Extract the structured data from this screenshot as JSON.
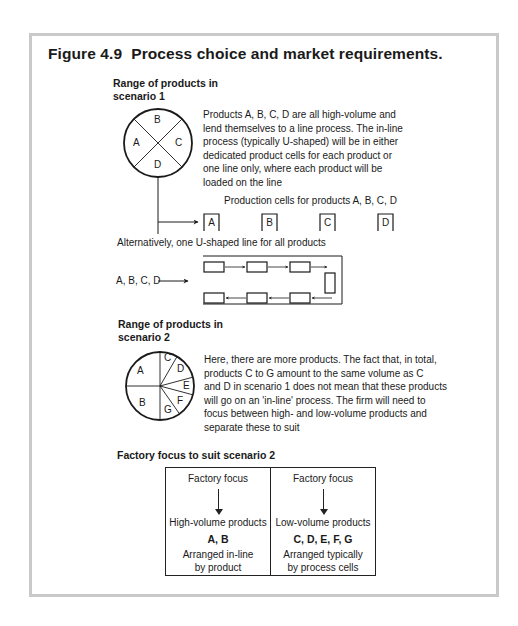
{
  "figure": {
    "number": "Figure 4.9",
    "title": "Process choice and market requirements."
  },
  "scenario1": {
    "heading_line1": "Range of products in",
    "heading_line2": "scenario 1",
    "pie_labels": [
      "A",
      "B",
      "C",
      "D"
    ],
    "description": [
      "Products A, B, C, D are all high-volume and",
      "lend themselves to a line process. The in-line",
      "process (typically U-shaped) will be in either",
      "dedicated product cells for each product or",
      "one line only, where each product will be",
      "loaded on the line"
    ],
    "cells_caption": "Production cells for products A, B, C, D",
    "cells": [
      "A",
      "B",
      "C",
      "D"
    ],
    "alternative_caption": "Alternatively, one U-shaped line for all products",
    "u_line_input": "A, B, C, D"
  },
  "scenario2": {
    "heading_line1": "Range of products in",
    "heading_line2": "scenario 2",
    "pie_labels": [
      "A",
      "B",
      "C",
      "D",
      "E",
      "F",
      "G"
    ],
    "description": [
      "Here, there are more products. The fact that, in total,",
      "products C to G amount to the same volume as C",
      "and D in scenario 1 does not mean that these products",
      "will go on an 'in-line' process. The firm will need to",
      "focus between high- and low-volume products and",
      "separate these to suit"
    ]
  },
  "factory_focus": {
    "heading": "Factory focus to suit scenario 2",
    "columns": [
      {
        "header": "Factory focus",
        "volume": "High-volume products",
        "products": "A, B",
        "arrangement_line1": "Arranged in-line",
        "arrangement_line2": "by product"
      },
      {
        "header": "Factory focus",
        "volume": "Low-volume products",
        "products": "C, D, E, F, G",
        "arrangement_line1": "Arranged typically",
        "arrangement_line2": "by process cells"
      }
    ]
  },
  "colors": {
    "frame_border": "#c9c9c9",
    "ink": "#1a1a1a",
    "background": "#ffffff"
  }
}
